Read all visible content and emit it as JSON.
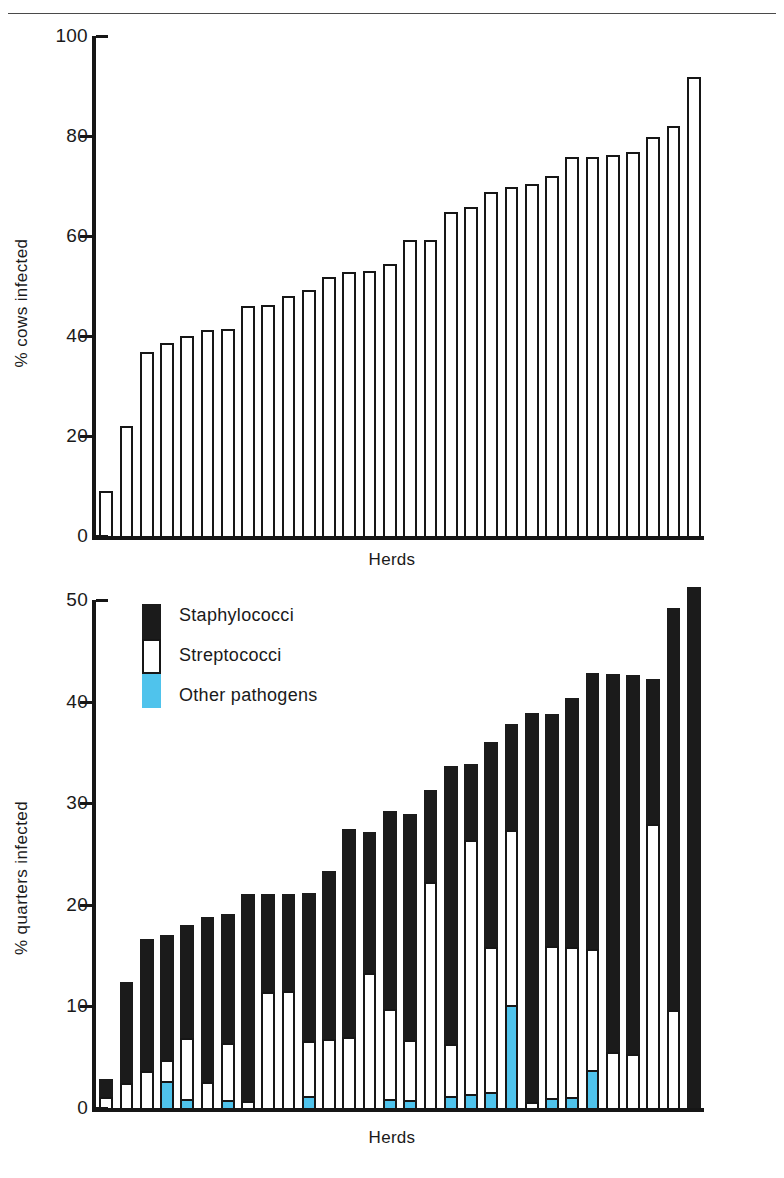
{
  "colors": {
    "ink": "#161616",
    "staphylococci": "#1b1b1b",
    "streptococci": "#ffffff",
    "other_pathogens": "#4FC3EC",
    "background": "#ffffff"
  },
  "figures": {
    "cows": {
      "ylabel": "% cows infected",
      "xlabel": "Herds",
      "yticks": [
        "0",
        "20",
        "40",
        "60",
        "80",
        "100"
      ]
    },
    "quarters": {
      "ylabel": "% quarters infected",
      "xlabel": "Herds",
      "yticks": [
        "0",
        "10",
        "20",
        "30",
        "40",
        "50"
      ],
      "legend": {
        "items": [
          {
            "label": "Staphylococci",
            "color": "#1b1b1b"
          },
          {
            "label": "Streptococci",
            "color": "#ffffff"
          },
          {
            "label": "Other pathogens",
            "color": "#4FC3EC"
          }
        ]
      }
    }
  },
  "chart_data": [
    {
      "type": "bar",
      "id": "cows-infected",
      "title": "",
      "xlabel": "Herds",
      "ylabel": "% cows infected",
      "ylim": [
        0,
        100
      ],
      "yticks": [
        0,
        20,
        40,
        60,
        80,
        100
      ],
      "grid": false,
      "legend": null,
      "categories": [
        "1",
        "2",
        "3",
        "4",
        "5",
        "6",
        "7",
        "8",
        "9",
        "10",
        "11",
        "12",
        "13",
        "14",
        "15",
        "16",
        "17",
        "18",
        "19",
        "20",
        "21",
        "22",
        "23",
        "24",
        "25",
        "26",
        "27",
        "28",
        "29",
        "30"
      ],
      "values": [
        9.0,
        22.0,
        36.8,
        38.6,
        40.0,
        41.2,
        41.4,
        46.0,
        46.2,
        48.0,
        49.2,
        51.8,
        52.9,
        53.1,
        54.4,
        59.3,
        59.3,
        64.9,
        65.9,
        68.8,
        69.8,
        70.4,
        72.0,
        75.9,
        75.9,
        76.2,
        76.8,
        79.9,
        82.0,
        91.8
      ]
    },
    {
      "type": "bar",
      "id": "quarters-infected",
      "title": "",
      "xlabel": "Herds",
      "ylabel": "% quarters infected",
      "ylim": [
        0,
        50
      ],
      "yticks": [
        0,
        10,
        20,
        30,
        40,
        50
      ],
      "grid": false,
      "stacked": true,
      "legend_position": "top-left",
      "categories": [
        "1",
        "2",
        "3",
        "4",
        "5",
        "6",
        "7",
        "8",
        "9",
        "10",
        "11",
        "12",
        "13",
        "14",
        "15",
        "16",
        "17",
        "18",
        "19",
        "20",
        "21",
        "22",
        "23",
        "24",
        "25",
        "26",
        "27",
        "28",
        "29",
        "30"
      ],
      "series": [
        {
          "name": "Other pathogens",
          "color": "#4FC3EC",
          "values": [
            0.0,
            0.0,
            0.0,
            2.5,
            0.7,
            0.0,
            0.6,
            0.0,
            0.0,
            0.0,
            1.0,
            0.0,
            0.0,
            0.0,
            0.7,
            0.6,
            0.0,
            1.0,
            1.2,
            1.4,
            9.9,
            0.0,
            0.8,
            0.9,
            3.5,
            0.0,
            0.0,
            0.0,
            0.0,
            0.0
          ]
        },
        {
          "name": "Streptococci",
          "color": "#ffffff",
          "values": [
            1.1,
            2.5,
            3.6,
            2.2,
            6.2,
            2.6,
            5.8,
            0.7,
            11.4,
            11.5,
            5.6,
            6.8,
            7.0,
            13.3,
            9.0,
            6.1,
            22.2,
            5.3,
            25.2,
            14.4,
            17.5,
            0.6,
            15.1,
            14.9,
            12.2,
            5.5,
            5.3,
            28.0,
            9.6,
            0.0
          ]
        },
        {
          "name": "Staphylococci",
          "color": "#1b1b1b",
          "values": [
            1.8,
            9.9,
            13.0,
            12.3,
            11.1,
            16.2,
            12.7,
            20.4,
            9.7,
            9.6,
            14.6,
            16.5,
            20.5,
            13.9,
            19.5,
            22.2,
            9.1,
            27.4,
            7.5,
            20.2,
            10.4,
            38.3,
            22.9,
            24.6,
            27.1,
            37.2,
            37.3,
            14.2,
            39.6,
            51.3
          ]
        }
      ],
      "totals": [
        2.9,
        12.4,
        16.6,
        17.0,
        18.0,
        18.8,
        19.1,
        21.1,
        21.1,
        21.1,
        21.2,
        23.3,
        27.5,
        27.2,
        29.2,
        28.9,
        31.3,
        33.7,
        33.9,
        36.0,
        37.8,
        38.9,
        38.8,
        40.4,
        42.8,
        42.7,
        42.6,
        42.2,
        49.2,
        51.3
      ]
    }
  ]
}
